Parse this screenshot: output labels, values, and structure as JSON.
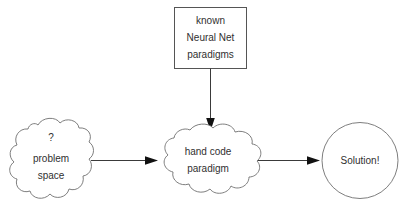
{
  "diagram": {
    "background_color": "#ffffff",
    "stroke_color": "#6f6f6f",
    "text_color": "#303030",
    "arrow_color": "#3a3a3a",
    "nodes": [
      {
        "id": "problem-space",
        "shape": "cloud",
        "lines": [
          "?",
          "problem",
          "space"
        ],
        "line1": "?",
        "line2": "problem",
        "line3": "space"
      },
      {
        "id": "known-paradigms",
        "shape": "rectangle",
        "lines": [
          "known",
          "Neural Net",
          "paradigms"
        ],
        "line1": "known",
        "line2": "Neural Net",
        "line3": "paradigms"
      },
      {
        "id": "hand-code-paradigm",
        "shape": "cloud",
        "lines": [
          "hand code",
          "paradigm"
        ],
        "line1": "hand code",
        "line2": "paradigm"
      },
      {
        "id": "solution",
        "shape": "circle",
        "lines": [
          "Solution!"
        ],
        "line1": "Solution!"
      }
    ],
    "edges": [
      {
        "id": "edge-problem-to-handcode",
        "from": "problem-space",
        "to": "hand-code-paradigm",
        "direction": "right",
        "label": ""
      },
      {
        "id": "edge-known-to-handcode",
        "from": "known-paradigms",
        "to": "hand-code-paradigm",
        "direction": "down",
        "label": ""
      },
      {
        "id": "edge-handcode-to-solution",
        "from": "hand-code-paradigm",
        "to": "solution",
        "direction": "right",
        "label": ""
      }
    ]
  }
}
